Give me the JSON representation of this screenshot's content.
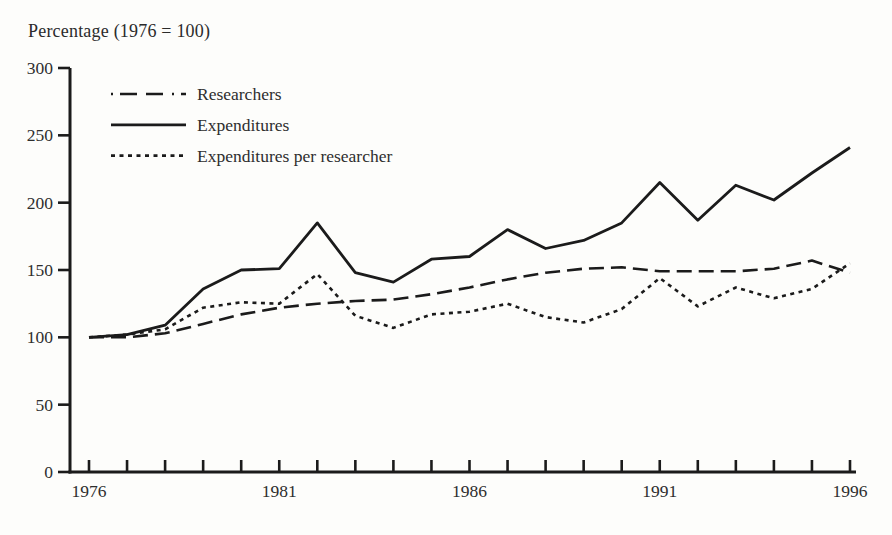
{
  "page": {
    "title": "Percentage (1976 = 100)"
  },
  "colors": {
    "line": "#1b1b1b",
    "text": "#2e2e2e",
    "background": "#fdfdfb"
  },
  "chart_data": {
    "type": "line",
    "title": "Percentage (1976 = 100)",
    "xlabel": "",
    "ylabel": "Percentage (1976 = 100)",
    "x": [
      1976,
      1977,
      1978,
      1979,
      1980,
      1981,
      1982,
      1983,
      1984,
      1985,
      1986,
      1987,
      1988,
      1989,
      1990,
      1991,
      1992,
      1993,
      1994,
      1995,
      1996
    ],
    "x_tick_labels": [
      "1976",
      "1981",
      "1986",
      "1991",
      "1996"
    ],
    "y_ticks": [
      0,
      50,
      100,
      150,
      200,
      250,
      300
    ],
    "xlim": [
      1976,
      1996
    ],
    "ylim": [
      0,
      300
    ],
    "grid": false,
    "legend_position": "top-left-inside",
    "series": [
      {
        "name": "Researchers",
        "style": "long-dash",
        "values": [
          100,
          100,
          103,
          110,
          117,
          122,
          125,
          127,
          128,
          132,
          137,
          143,
          148,
          151,
          152,
          149,
          149,
          149,
          151,
          157,
          148
        ]
      },
      {
        "name": "Expenditures",
        "style": "solid",
        "values": [
          100,
          102,
          109,
          136,
          150,
          151,
          185,
          148,
          141,
          158,
          160,
          180,
          166,
          172,
          185,
          215,
          187,
          213,
          202,
          222,
          241
        ]
      },
      {
        "name": "Expenditures per researcher",
        "style": "dotted",
        "values": [
          100,
          102,
          106,
          122,
          126,
          125,
          147,
          116,
          107,
          117,
          119,
          125,
          115,
          111,
          121,
          144,
          123,
          137,
          129,
          136,
          155
        ]
      }
    ]
  }
}
